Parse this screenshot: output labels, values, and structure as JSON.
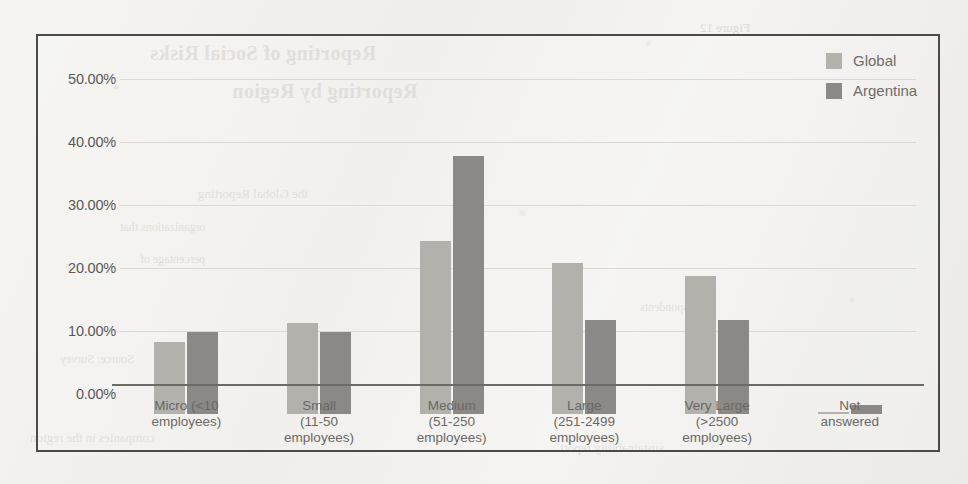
{
  "chart_data": {
    "type": "bar",
    "title": "",
    "xlabel": "",
    "ylabel": "",
    "ylim": [
      0,
      55
    ],
    "grid": true,
    "legend_position": "top-right",
    "categories": [
      "Micro (<10 employees)",
      "Small (11-50 employees)",
      "Medium (51-250 employees)",
      "Large (251-2499 employees)",
      "Very Large (>2500 employees)",
      "Not answered"
    ],
    "category_lines": [
      [
        "Micro (<10",
        "employees)"
      ],
      [
        "Small",
        "(11-50",
        "employees)"
      ],
      [
        "Medium",
        "(51-250",
        "employees)"
      ],
      [
        "Large",
        "(251-2499",
        "employees)"
      ],
      [
        "Very Large",
        "(>2500",
        "employees)"
      ],
      [
        "Not",
        "answered"
      ]
    ],
    "series": [
      {
        "name": "Global",
        "color": "#b3b1ac",
        "values": [
          11.5,
          14.5,
          27.5,
          24.0,
          22.0,
          0.3
        ]
      },
      {
        "name": "Argentina",
        "color": "#8b8985",
        "values": [
          13.0,
          13.0,
          41.0,
          15.0,
          15.0,
          1.5
        ]
      }
    ],
    "y_ticks": [
      {
        "value": 0,
        "label": "0.00%"
      },
      {
        "value": 10,
        "label": "10.00%"
      },
      {
        "value": 20,
        "label": "20.00%"
      },
      {
        "value": 30,
        "label": "30.00%"
      },
      {
        "value": 40,
        "label": "40.00%"
      },
      {
        "value": 50,
        "label": "50.00%"
      }
    ]
  },
  "legend": {
    "items": [
      {
        "label": "Global",
        "swatch": "global-swatch"
      },
      {
        "label": "Argentina",
        "swatch": "argentina-swatch"
      }
    ]
  },
  "background_bleed": {
    "title_line_1": "Reporting of Social Risks",
    "title_line_2": "Reporting by Region",
    "line_1": "the Global Reporting",
    "line_2": "organizations that",
    "line_3": "percentage of",
    "line_4": "Source: Survey",
    "line_5": "respondents",
    "line_6": "companies in the region",
    "line_7": "sustainability report",
    "line_8": "Figure 12"
  }
}
